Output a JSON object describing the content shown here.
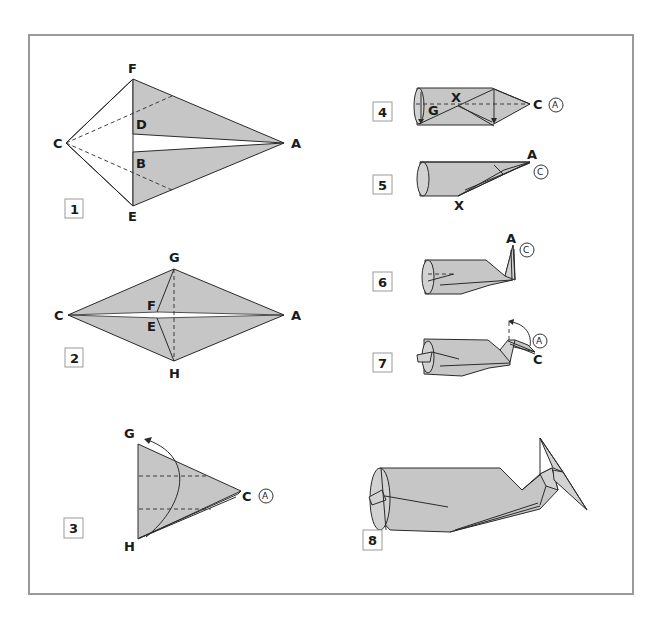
{
  "figure": {
    "type": "origami folding diagram",
    "frame_color": "#9a9a9a",
    "paper_fill": "#c6c6c6"
  },
  "steps": [
    {
      "number": "1",
      "labels": {
        "F": "F",
        "D": "D",
        "C": "C",
        "B": "B",
        "E": "E",
        "A": "A"
      }
    },
    {
      "number": "2",
      "labels": {
        "G": "G",
        "F": "F",
        "C": "C",
        "E": "E",
        "H": "H",
        "A": "A"
      }
    },
    {
      "number": "3",
      "labels": {
        "G": "G",
        "H": "H",
        "C": "C",
        "A_circled": "A"
      }
    },
    {
      "number": "4",
      "labels": {
        "G": "G",
        "X": "X",
        "C": "C",
        "A_circled": "A"
      }
    },
    {
      "number": "5",
      "labels": {
        "A": "A",
        "C_circled": "C",
        "X": "X"
      }
    },
    {
      "number": "6",
      "labels": {
        "A": "A",
        "C_circled": "C"
      }
    },
    {
      "number": "7",
      "labels": {
        "A_circled": "A",
        "C": "C"
      }
    },
    {
      "number": "8",
      "labels": {}
    }
  ]
}
